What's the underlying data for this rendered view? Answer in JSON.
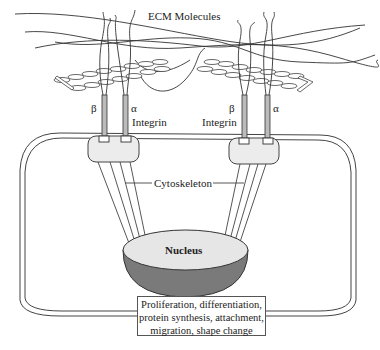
{
  "diagram": {
    "labels": {
      "ecm": "ECM Molecules",
      "beta_left": "β",
      "alpha_left": "α",
      "integrin_left": "Integrin",
      "beta_right": "β",
      "alpha_right": "α",
      "integrin_right": "Integrin",
      "cytoskeleton": "Cytoskeleton",
      "nucleus": "Nucleus"
    },
    "outcome_lines": [
      "Proliferation, differentiation,",
      "protein synthesis, attachment,",
      "migration, shape change"
    ],
    "colors": {
      "line": "#444444",
      "nucleus_top": "#e6e6e6",
      "nucleus_bottom": "#7a7a7a",
      "focal_adhesion": "#ececec"
    }
  }
}
